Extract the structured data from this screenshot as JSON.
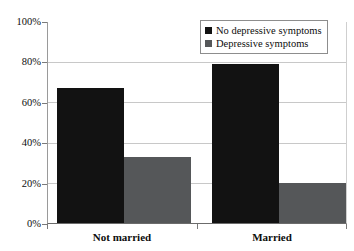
{
  "chart_data": {
    "type": "bar",
    "title": "",
    "subtitle": "",
    "xlabel": "",
    "ylabel": "",
    "categories": [
      "Not married",
      "Married"
    ],
    "series": [
      {
        "name": "No depressive symptoms",
        "values": [
          67,
          79
        ],
        "color": "#121212"
      },
      {
        "name": "Depressive symptoms",
        "values": [
          33,
          20
        ],
        "color": "#555759"
      }
    ],
    "ylim": [
      0,
      100
    ],
    "ytick_values": [
      0,
      20,
      40,
      60,
      80,
      100
    ],
    "ytick_labels": [
      "0%",
      "20%",
      "40%",
      "60%",
      "80%",
      "100%"
    ],
    "grid": true,
    "legend_position": "top-right",
    "value_suffix": "%"
  },
  "legend": {
    "entries": [
      {
        "label": "No depressive symptoms",
        "swatch": "dark-square-swatch"
      },
      {
        "label": "Depressive symptoms",
        "swatch": "gray-square-swatch"
      }
    ]
  },
  "axes": {
    "y": {
      "labels": [
        "100%",
        "80%",
        "60%",
        "40%",
        "20%",
        "0%"
      ]
    },
    "x": {
      "labels": [
        "Not married",
        "Married"
      ]
    }
  },
  "colors": {
    "series_no_depressive": "#121212",
    "series_depressive": "#555759",
    "gridline": "#c8c8c8",
    "axis": "#6b6b6b",
    "background": "#ffffff",
    "text": "#0d0d0d"
  }
}
